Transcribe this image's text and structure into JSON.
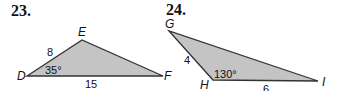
{
  "problems": [
    {
      "number": "23.",
      "vertices": {
        "a": "D",
        "b": "E",
        "c": "F"
      },
      "side_labels": {
        "de": "8",
        "df": "15"
      },
      "angle_label": "35°"
    },
    {
      "number": "24.",
      "vertices": {
        "a": "G",
        "b": "H",
        "c": "I"
      },
      "side_labels": {
        "gh": "4",
        "hi": "6"
      },
      "angle_label": "130°"
    }
  ],
  "colors": {
    "fill": "#c4c4c4",
    "stroke": "#333333"
  }
}
